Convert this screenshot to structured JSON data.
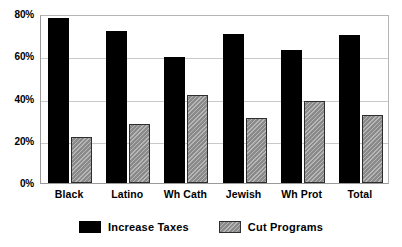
{
  "chart_data": {
    "type": "bar",
    "title": "",
    "xlabel": "",
    "ylabel": "",
    "ylim": [
      0,
      80
    ],
    "ytick_labels": [
      "0%",
      "20%",
      "40%",
      "60%",
      "80%"
    ],
    "ytick_values": [
      0,
      20,
      40,
      60,
      80
    ],
    "grid": true,
    "legend_position": "bottom",
    "categories": [
      "Black",
      "Latino",
      "Wh Cath",
      "Jewish",
      "Wh Prot",
      "Total"
    ],
    "series": [
      {
        "name": "Increase Taxes",
        "color": "#000000",
        "values": [
          78,
          72,
          59.5,
          70.5,
          63,
          70
        ]
      },
      {
        "name": "Cut Programs",
        "color": "#8a8a8a",
        "values": [
          22,
          28,
          41.5,
          31,
          39,
          32
        ]
      }
    ]
  },
  "legend": {
    "items": [
      {
        "label": "Increase Taxes",
        "swatch": "increase"
      },
      {
        "label": "Cut Programs",
        "swatch": "cut"
      }
    ]
  }
}
